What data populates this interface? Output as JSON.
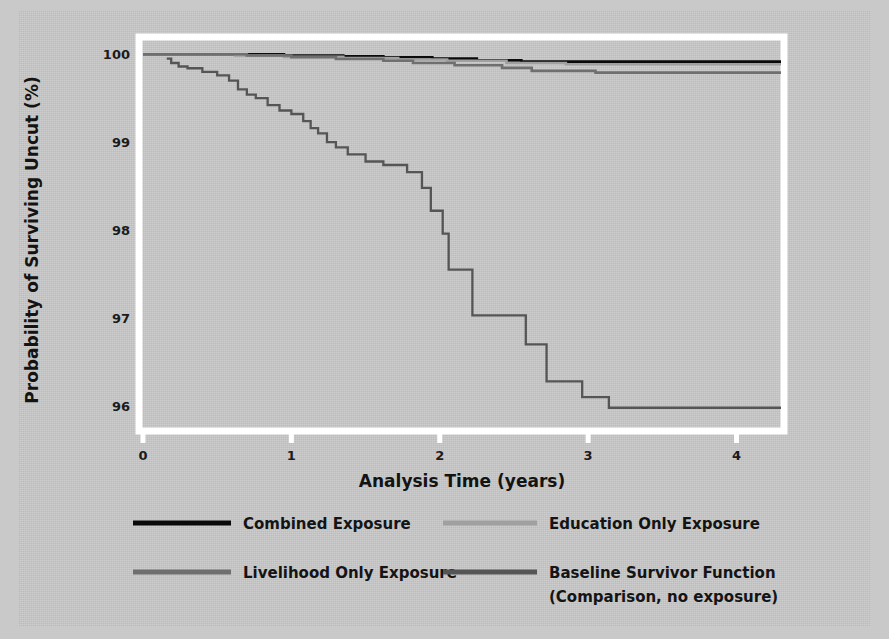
{
  "figure": {
    "background_color": "#c9c9c9",
    "plot_border_color": "#ffffff"
  },
  "chart_data": {
    "type": "line",
    "subtype": "kaplan-meier-step",
    "title": "",
    "xlabel": "Analysis Time (years)",
    "ylabel": "Probability of Surviving Uncut (%)",
    "xlim": [
      0,
      4.3
    ],
    "ylim": [
      95.75,
      100.15
    ],
    "xticks": [
      0,
      1,
      2,
      3,
      4
    ],
    "xtick_labels": [
      "0",
      "1",
      "2",
      "3",
      "4"
    ],
    "yticks": [
      96,
      97,
      98,
      99,
      100
    ],
    "ytick_labels": [
      "96",
      "97",
      "98",
      "99",
      "100"
    ],
    "grid": false,
    "legend_position": "below-plot",
    "series": [
      {
        "name": "Combined Exposure",
        "color": "#0a0a0a",
        "width": 2.6,
        "points": [
          [
            0.0,
            100.0
          ],
          [
            0.95,
            100.0
          ],
          [
            0.95,
            99.985
          ],
          [
            1.35,
            99.985
          ],
          [
            1.35,
            99.975
          ],
          [
            1.62,
            99.975
          ],
          [
            1.62,
            99.965
          ],
          [
            1.95,
            99.965
          ],
          [
            1.95,
            99.95
          ],
          [
            2.25,
            99.95
          ],
          [
            2.25,
            99.93
          ],
          [
            2.55,
            99.93
          ],
          [
            2.55,
            99.915
          ],
          [
            4.3,
            99.915
          ]
        ]
      },
      {
        "name": "Education Only Exposure",
        "color": "#a0a0a0",
        "width": 2.6,
        "points": [
          [
            0.0,
            100.0
          ],
          [
            0.62,
            100.0
          ],
          [
            0.62,
            99.985
          ],
          [
            0.95,
            99.985
          ],
          [
            0.95,
            99.97
          ],
          [
            1.35,
            99.97
          ],
          [
            1.35,
            99.955
          ],
          [
            1.72,
            99.955
          ],
          [
            1.72,
            99.94
          ],
          [
            2.05,
            99.94
          ],
          [
            2.05,
            99.925
          ],
          [
            2.45,
            99.925
          ],
          [
            2.45,
            99.9
          ],
          [
            2.85,
            99.9
          ],
          [
            2.85,
            99.885
          ],
          [
            4.3,
            99.885
          ]
        ]
      },
      {
        "name": "Livelihood Only Exposure",
        "color": "#6f6f6f",
        "width": 2.6,
        "points": [
          [
            0.0,
            100.0
          ],
          [
            0.7,
            100.0
          ],
          [
            0.7,
            99.985
          ],
          [
            1.0,
            99.985
          ],
          [
            1.0,
            99.965
          ],
          [
            1.3,
            99.965
          ],
          [
            1.3,
            99.945
          ],
          [
            1.62,
            99.945
          ],
          [
            1.62,
            99.925
          ],
          [
            1.82,
            99.925
          ],
          [
            1.82,
            99.9
          ],
          [
            2.1,
            99.9
          ],
          [
            2.1,
            99.875
          ],
          [
            2.42,
            99.875
          ],
          [
            2.42,
            99.845
          ],
          [
            2.62,
            99.845
          ],
          [
            2.62,
            99.81
          ],
          [
            3.05,
            99.81
          ],
          [
            3.05,
            99.79
          ],
          [
            4.3,
            99.79
          ]
        ]
      },
      {
        "name": "Baseline Survivor Function (Comparison, no exposure)",
        "color": "#555555",
        "width": 2.3,
        "points": [
          [
            0.16,
            99.95
          ],
          [
            0.19,
            99.95
          ],
          [
            0.19,
            99.9
          ],
          [
            0.24,
            99.9
          ],
          [
            0.24,
            99.86
          ],
          [
            0.3,
            99.86
          ],
          [
            0.3,
            99.84
          ],
          [
            0.4,
            99.84
          ],
          [
            0.4,
            99.8
          ],
          [
            0.5,
            99.8
          ],
          [
            0.5,
            99.76
          ],
          [
            0.58,
            99.76
          ],
          [
            0.58,
            99.7
          ],
          [
            0.64,
            99.7
          ],
          [
            0.64,
            99.6
          ],
          [
            0.7,
            99.6
          ],
          [
            0.7,
            99.54
          ],
          [
            0.76,
            99.54
          ],
          [
            0.76,
            99.5
          ],
          [
            0.84,
            99.5
          ],
          [
            0.84,
            99.42
          ],
          [
            0.92,
            99.42
          ],
          [
            0.92,
            99.36
          ],
          [
            1.0,
            99.36
          ],
          [
            1.0,
            99.32
          ],
          [
            1.08,
            99.32
          ],
          [
            1.08,
            99.24
          ],
          [
            1.13,
            99.24
          ],
          [
            1.13,
            99.16
          ],
          [
            1.18,
            99.16
          ],
          [
            1.18,
            99.1
          ],
          [
            1.24,
            99.1
          ],
          [
            1.24,
            99.0
          ],
          [
            1.3,
            99.0
          ],
          [
            1.3,
            98.94
          ],
          [
            1.38,
            98.94
          ],
          [
            1.38,
            98.86
          ],
          [
            1.5,
            98.86
          ],
          [
            1.5,
            98.78
          ],
          [
            1.62,
            98.78
          ],
          [
            1.62,
            98.74
          ],
          [
            1.78,
            98.74
          ],
          [
            1.78,
            98.66
          ],
          [
            1.88,
            98.66
          ],
          [
            1.88,
            98.48
          ],
          [
            1.94,
            98.48
          ],
          [
            1.94,
            98.22
          ],
          [
            2.02,
            98.22
          ],
          [
            2.02,
            97.96
          ],
          [
            2.06,
            97.96
          ],
          [
            2.06,
            97.55
          ],
          [
            2.22,
            97.55
          ],
          [
            2.22,
            97.03
          ],
          [
            2.58,
            97.03
          ],
          [
            2.58,
            96.7
          ],
          [
            2.72,
            96.7
          ],
          [
            2.72,
            96.28
          ],
          [
            2.96,
            96.28
          ],
          [
            2.96,
            96.1
          ],
          [
            3.14,
            96.1
          ],
          [
            3.14,
            95.98
          ],
          [
            4.3,
            95.98
          ]
        ]
      }
    ]
  },
  "legend": {
    "entries": [
      {
        "label": "Combined Exposure",
        "color": "#0a0a0a",
        "sub": ""
      },
      {
        "label": "Education Only Exposure",
        "color": "#a0a0a0",
        "sub": ""
      },
      {
        "label": "Livelihood Only Exposure",
        "color": "#6f6f6f",
        "sub": ""
      },
      {
        "label": "Baseline Survivor Function",
        "color": "#555555",
        "sub": "(Comparison, no exposure)"
      }
    ]
  }
}
